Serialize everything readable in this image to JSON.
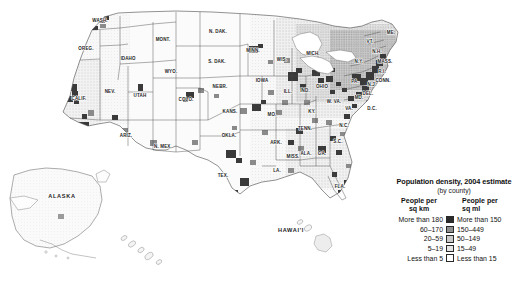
{
  "figure": {
    "name": "us-population-density-map-2004",
    "background": "#ffffff"
  },
  "legend": {
    "title": "Population density, 2004 estimate",
    "subtitle": "(by county)",
    "header_left": "People per\nsq km",
    "header_left_line1": "People per",
    "header_left_line2": "sq km",
    "header_right_line1": "People per",
    "header_right_line2": "sq ml",
    "rows": [
      {
        "left": "More than 180",
        "right": "More than 150",
        "color": "#2b2b2b"
      },
      {
        "left": "60–170",
        "right": "150–449",
        "color": "#8f8f8f"
      },
      {
        "left": "20–59",
        "right": "50–149",
        "color": "#c9c9c9"
      },
      {
        "left": "5–19",
        "right": "15–49",
        "color": "#e4e4e4"
      },
      {
        "left": "Less than 5",
        "right": "Less than 15",
        "color": "#ffffff"
      }
    ]
  },
  "map": {
    "state_labels": [
      {
        "text": "WASH.",
        "x": 100,
        "y": 22,
        "size": "sm"
      },
      {
        "text": "OREG.",
        "x": 86,
        "y": 50,
        "size": "sm"
      },
      {
        "text": "IDAHO",
        "x": 128,
        "y": 60,
        "size": "sm"
      },
      {
        "text": "MONT.",
        "x": 163,
        "y": 41,
        "size": "sm"
      },
      {
        "text": "WYO.",
        "x": 171,
        "y": 73,
        "size": "sm"
      },
      {
        "text": "NEV.",
        "x": 110,
        "y": 93,
        "size": "sm"
      },
      {
        "text": "UTAH",
        "x": 140,
        "y": 97,
        "size": "sm"
      },
      {
        "text": "CALIF.",
        "x": 79,
        "y": 100,
        "size": "sm"
      },
      {
        "text": "ARIZ.",
        "x": 126,
        "y": 137,
        "size": "sm"
      },
      {
        "text": "N. MEX.",
        "x": 163,
        "y": 148,
        "size": "sm"
      },
      {
        "text": "COLO.",
        "x": 186,
        "y": 101,
        "size": "sm"
      },
      {
        "text": "N. DAK.",
        "x": 218,
        "y": 33,
        "size": "sm"
      },
      {
        "text": "S. DAK.",
        "x": 217,
        "y": 63,
        "size": "sm"
      },
      {
        "text": "NEBR.",
        "x": 220,
        "y": 88,
        "size": "sm"
      },
      {
        "text": "KANS.",
        "x": 230,
        "y": 113,
        "size": "sm"
      },
      {
        "text": "OKLA.",
        "x": 229,
        "y": 137,
        "size": "sm"
      },
      {
        "text": "TEX.",
        "x": 223,
        "y": 177,
        "size": "sm"
      },
      {
        "text": "MINN.",
        "x": 253,
        "y": 52,
        "size": "sm"
      },
      {
        "text": "IOWA",
        "x": 262,
        "y": 82,
        "size": "sm"
      },
      {
        "text": "MO.",
        "x": 272,
        "y": 116,
        "size": "sm"
      },
      {
        "text": "ARK.",
        "x": 276,
        "y": 144,
        "size": "sm"
      },
      {
        "text": "LA.",
        "x": 277,
        "y": 172,
        "size": "sm"
      },
      {
        "text": "MISS.",
        "x": 293,
        "y": 158,
        "size": "sm"
      },
      {
        "text": "WIS.",
        "x": 282,
        "y": 61,
        "size": "sm"
      },
      {
        "text": "ILL.",
        "x": 288,
        "y": 93,
        "size": "sm"
      },
      {
        "text": "IND.",
        "x": 305,
        "y": 92,
        "size": "sm"
      },
      {
        "text": "MICH.",
        "x": 313,
        "y": 55,
        "size": "sm"
      },
      {
        "text": "OHIO",
        "x": 322,
        "y": 88,
        "size": "sm"
      },
      {
        "text": "KY.",
        "x": 312,
        "y": 113,
        "size": "sm"
      },
      {
        "text": "TENN.",
        "x": 305,
        "y": 130,
        "size": "sm"
      },
      {
        "text": "ALA.",
        "x": 306,
        "y": 155,
        "size": "sm"
      },
      {
        "text": "GA.",
        "x": 322,
        "y": 155,
        "size": "sm"
      },
      {
        "text": "FLA.",
        "x": 340,
        "y": 188,
        "size": "sm"
      },
      {
        "text": "S.C.",
        "x": 338,
        "y": 143,
        "size": "sm"
      },
      {
        "text": "N.C.",
        "x": 344,
        "y": 127,
        "size": "sm"
      },
      {
        "text": "VA.",
        "x": 349,
        "y": 110,
        "size": "sm"
      },
      {
        "text": "W. VA.",
        "x": 334,
        "y": 103,
        "size": "sm"
      },
      {
        "text": "MD.",
        "x": 359,
        "y": 99,
        "size": "sm"
      },
      {
        "text": "DEL.",
        "x": 368,
        "y": 95,
        "size": "sm"
      },
      {
        "text": "D.C.",
        "x": 372,
        "y": 110,
        "size": "sm"
      },
      {
        "text": "PA.",
        "x": 355,
        "y": 83,
        "size": "sm"
      },
      {
        "text": "N.J.",
        "x": 372,
        "y": 86,
        "size": "sm"
      },
      {
        "text": "N.Y.",
        "x": 359,
        "y": 63,
        "size": "sm"
      },
      {
        "text": "CONN.",
        "x": 383,
        "y": 82,
        "size": "sm"
      },
      {
        "text": "R.I.",
        "x": 382,
        "y": 73,
        "size": "sm"
      },
      {
        "text": "MASS.",
        "x": 385,
        "y": 63,
        "size": "sm"
      },
      {
        "text": "N.H.",
        "x": 377,
        "y": 53,
        "size": "sm"
      },
      {
        "text": "VT.",
        "x": 370,
        "y": 43,
        "size": "sm"
      },
      {
        "text": "ME.",
        "x": 391,
        "y": 34,
        "size": "sm"
      },
      {
        "text": "ALASKA",
        "x": 62,
        "y": 198,
        "size": "inset"
      },
      {
        "text": "HAWAI'I",
        "x": 291,
        "y": 232,
        "size": "inset"
      }
    ]
  }
}
